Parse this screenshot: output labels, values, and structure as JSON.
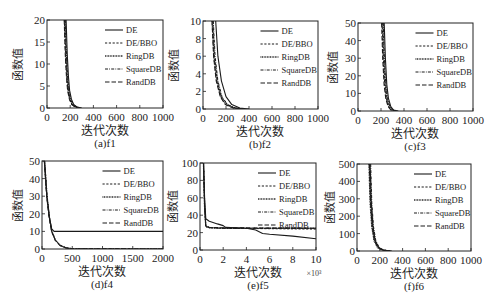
{
  "figure": {
    "legend": [
      "DE",
      "DE/BBO",
      "RingDB",
      "SquareDB",
      "RandDB"
    ],
    "xlabel": "迭代次数",
    "ylabel": "函数值"
  },
  "chart_data": [
    {
      "type": "line",
      "id": "a",
      "caption": "(a)f1",
      "title": "",
      "xlabel": "迭代次数",
      "ylabel": "函数值",
      "xlim": [
        0,
        1000
      ],
      "ylim": [
        0,
        20
      ],
      "xticks": [
        "0",
        "200",
        "400",
        "600",
        "800",
        "1000"
      ],
      "yticks": [
        "0",
        "5",
        "10",
        "15",
        "20"
      ],
      "legend_position": "upper right",
      "grid": false,
      "series": [
        {
          "name": "DE",
          "x": [
            165,
            175,
            185,
            195,
            210,
            230,
            260,
            300
          ],
          "y": [
            20,
            12,
            7,
            4,
            2,
            0.8,
            0.2,
            0
          ]
        },
        {
          "name": "DE/BBO",
          "x": [
            150,
            160,
            170,
            180,
            195,
            215,
            245,
            280
          ],
          "y": [
            20,
            12,
            7,
            4,
            2,
            0.8,
            0.2,
            0
          ]
        },
        {
          "name": "RingDB",
          "x": [
            155,
            165,
            175,
            185,
            200,
            220,
            250,
            285
          ],
          "y": [
            20,
            12,
            7,
            4,
            2,
            0.8,
            0.2,
            0
          ]
        },
        {
          "name": "SquareDB",
          "x": [
            158,
            168,
            178,
            188,
            203,
            223,
            253,
            290
          ],
          "y": [
            20,
            12,
            7,
            4,
            2,
            0.8,
            0.2,
            0
          ]
        },
        {
          "name": "RandDB",
          "x": [
            148,
            158,
            168,
            178,
            193,
            213,
            243,
            278
          ],
          "y": [
            20,
            12,
            7,
            4,
            2,
            0.8,
            0.2,
            0
          ]
        }
      ]
    },
    {
      "type": "line",
      "id": "b",
      "caption": "(b)f2",
      "title": "",
      "xlabel": "迭代次数",
      "ylabel": "函数值",
      "xlim": [
        0,
        1000
      ],
      "ylim": [
        0,
        10
      ],
      "xticks": [
        "0",
        "200",
        "400",
        "600",
        "800",
        "1000"
      ],
      "yticks": [
        "0",
        "2",
        "4",
        "6",
        "8",
        "10"
      ],
      "legend_position": "upper right",
      "grid": false,
      "series": [
        {
          "name": "DE",
          "x": [
            110,
            130,
            160,
            200,
            250,
            320,
            400
          ],
          "y": [
            10,
            6,
            3.2,
            1.4,
            0.5,
            0.1,
            0
          ]
        },
        {
          "name": "DE/BBO",
          "x": [
            85,
            100,
            125,
            160,
            210,
            280,
            360
          ],
          "y": [
            10,
            6,
            3.2,
            1.4,
            0.5,
            0.1,
            0
          ]
        },
        {
          "name": "RingDB",
          "x": [
            80,
            95,
            120,
            155,
            200,
            270,
            350
          ],
          "y": [
            10,
            6,
            3.2,
            1.4,
            0.5,
            0.1,
            0
          ]
        },
        {
          "name": "SquareDB",
          "x": [
            90,
            105,
            130,
            165,
            215,
            285,
            365
          ],
          "y": [
            10,
            6,
            3.2,
            1.4,
            0.5,
            0.1,
            0
          ]
        },
        {
          "name": "RandDB",
          "x": [
            78,
            92,
            115,
            150,
            195,
            265,
            345
          ],
          "y": [
            10,
            6,
            3.2,
            1.4,
            0.5,
            0.1,
            0
          ]
        }
      ]
    },
    {
      "type": "line",
      "id": "c",
      "caption": "(c)f3",
      "title": "",
      "xlabel": "迭代次数",
      "ylabel": "函数值",
      "xlim": [
        0,
        1000
      ],
      "ylim": [
        0,
        50
      ],
      "xticks": [
        "0",
        "200",
        "400",
        "600",
        "800",
        "1000"
      ],
      "yticks": [
        "0",
        "10",
        "20",
        "30",
        "40",
        "50"
      ],
      "legend_position": "upper right",
      "grid": false,
      "series": [
        {
          "name": "DE",
          "x": [
            228,
            238,
            250,
            265,
            285,
            310,
            350
          ],
          "y": [
            50,
            30,
            15,
            7,
            2.5,
            0.5,
            0
          ]
        },
        {
          "name": "DE/BBO",
          "x": [
            210,
            220,
            232,
            247,
            267,
            292,
            330
          ],
          "y": [
            50,
            30,
            15,
            7,
            2.5,
            0.5,
            0
          ]
        },
        {
          "name": "RingDB",
          "x": [
            215,
            225,
            237,
            252,
            272,
            297,
            335
          ],
          "y": [
            50,
            30,
            15,
            7,
            2.5,
            0.5,
            0
          ]
        },
        {
          "name": "SquareDB",
          "x": [
            220,
            230,
            242,
            257,
            277,
            302,
            340
          ],
          "y": [
            50,
            30,
            15,
            7,
            2.5,
            0.5,
            0
          ]
        },
        {
          "name": "RandDB",
          "x": [
            205,
            215,
            227,
            242,
            262,
            287,
            325
          ],
          "y": [
            50,
            30,
            15,
            7,
            2.5,
            0.5,
            0
          ]
        }
      ]
    },
    {
      "type": "line",
      "id": "d",
      "caption": "(d)f4",
      "title": "",
      "xlabel": "迭代次数",
      "ylabel": "函数值",
      "xlim": [
        0,
        2000
      ],
      "ylim": [
        0,
        50
      ],
      "xticks": [
        "0",
        "500",
        "1000",
        "1500",
        "2000"
      ],
      "yticks": [
        "0",
        "10",
        "20",
        "30",
        "40",
        "50"
      ],
      "legend_position": "upper right",
      "grid": false,
      "series": [
        {
          "name": "DE",
          "x": [
            40,
            80,
            120,
            160,
            200,
            2000
          ],
          "y": [
            50,
            30,
            18,
            11.5,
            10,
            10
          ]
        },
        {
          "name": "DE/BBO",
          "x": [
            40,
            80,
            120,
            160,
            220,
            300,
            400,
            500,
            2000
          ],
          "y": [
            50,
            30,
            18,
            10,
            5,
            2,
            0.6,
            0.1,
            0
          ]
        },
        {
          "name": "RingDB",
          "x": [
            42,
            82,
            122,
            162,
            222,
            302,
            402,
            502,
            2000
          ],
          "y": [
            50,
            30,
            18,
            10,
            5,
            2,
            0.6,
            0.1,
            0
          ]
        },
        {
          "name": "SquareDB",
          "x": [
            44,
            84,
            124,
            164,
            224,
            304,
            404,
            504,
            2000
          ],
          "y": [
            50,
            30,
            18,
            10,
            5,
            2,
            0.6,
            0.1,
            0
          ]
        },
        {
          "name": "RandDB",
          "x": [
            38,
            78,
            118,
            158,
            218,
            298,
            398,
            498,
            2000
          ],
          "y": [
            50,
            30,
            18,
            10,
            5,
            2,
            0.6,
            0.1,
            0
          ]
        }
      ]
    },
    {
      "type": "line",
      "id": "e",
      "caption": "(e)f5",
      "title": "",
      "xlabel": "迭代次数",
      "ylabel": "函数值",
      "x_multiplier": "×10³",
      "xlim": [
        0,
        10
      ],
      "ylim": [
        0,
        100
      ],
      "xticks": [
        "0",
        "2",
        "4",
        "6",
        "8",
        "10"
      ],
      "yticks": [
        "0",
        "20",
        "40",
        "60",
        "80",
        "100"
      ],
      "legend_position": "upper right",
      "grid": false,
      "series": [
        {
          "name": "DE",
          "x": [
            0.3,
            0.4,
            0.5,
            0.8,
            1.5,
            2.0,
            2.2,
            4.0,
            4.8,
            5.4,
            6.0,
            8.0,
            10.0
          ],
          "y": [
            100,
            60,
            36,
            33,
            30,
            28,
            26,
            25,
            23,
            19,
            18,
            16,
            13
          ]
        },
        {
          "name": "DE/BBO",
          "x": [
            0.3,
            0.4,
            0.5,
            0.8,
            2.0,
            10.0
          ],
          "y": [
            100,
            50,
            28,
            26,
            25,
            24
          ]
        },
        {
          "name": "RingDB",
          "x": [
            0.3,
            0.4,
            0.5,
            0.8,
            2.0,
            10.0
          ],
          "y": [
            100,
            50,
            27,
            25.5,
            25,
            25
          ]
        },
        {
          "name": "SquareDB",
          "x": [
            0.3,
            0.4,
            0.5,
            0.8,
            2.0,
            10.0
          ],
          "y": [
            100,
            50,
            27,
            25.5,
            25,
            25
          ]
        },
        {
          "name": "RandDB",
          "x": [
            0.3,
            0.4,
            0.5,
            0.8,
            2.0,
            10.0
          ],
          "y": [
            100,
            50,
            27,
            26,
            25.5,
            25
          ]
        }
      ]
    },
    {
      "type": "line",
      "id": "f",
      "caption": "(f)f6",
      "title": "",
      "xlabel": "迭代次数",
      "ylabel": "函数值",
      "xlim": [
        0,
        1000
      ],
      "ylim": [
        0,
        500
      ],
      "xticks": [
        "0",
        "200",
        "400",
        "600",
        "800",
        "1000"
      ],
      "yticks": [
        "0",
        "100",
        "200",
        "300",
        "400",
        "500"
      ],
      "legend_position": "upper right",
      "grid": false,
      "series": [
        {
          "name": "DE",
          "x": [
            115,
            125,
            140,
            160,
            190,
            230,
            300
          ],
          "y": [
            500,
            280,
            140,
            60,
            20,
            5,
            0
          ]
        },
        {
          "name": "DE/BBO",
          "x": [
            110,
            120,
            135,
            155,
            185,
            225,
            295
          ],
          "y": [
            500,
            280,
            140,
            60,
            20,
            5,
            0
          ]
        },
        {
          "name": "RingDB",
          "x": [
            105,
            115,
            130,
            150,
            180,
            220,
            290
          ],
          "y": [
            500,
            280,
            140,
            60,
            20,
            5,
            0
          ]
        },
        {
          "name": "SquareDB",
          "x": [
            120,
            130,
            145,
            165,
            195,
            235,
            305
          ],
          "y": [
            500,
            280,
            140,
            60,
            20,
            5,
            0
          ]
        },
        {
          "name": "RandDB",
          "x": [
            108,
            118,
            133,
            153,
            183,
            223,
            293
          ],
          "y": [
            500,
            280,
            140,
            60,
            20,
            5,
            0
          ]
        }
      ]
    }
  ]
}
